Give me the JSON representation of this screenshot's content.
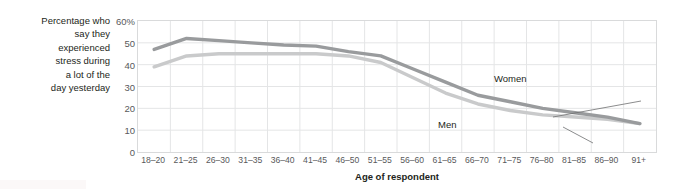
{
  "chart_data": {
    "type": "line",
    "title": "",
    "subtitle": "",
    "ylabel": "Percentage who say they experienced stress during a lot of the day yesterday",
    "xlabel": "Age of respondent",
    "categories": [
      "18–20",
      "21–25",
      "26–30",
      "31–35",
      "36–40",
      "41–45",
      "46–50",
      "51–55",
      "56–60",
      "61–65",
      "66–70",
      "71–75",
      "76–80",
      "81–85",
      "86–90",
      "91+"
    ],
    "ylim": [
      0,
      60
    ],
    "yticks": [
      0,
      10,
      20,
      30,
      40,
      50,
      60
    ],
    "ytick_labels": [
      "0",
      "10",
      "20",
      "30",
      "40",
      "50",
      "60%"
    ],
    "grid": true,
    "legend_position": "inline-annotations",
    "series": [
      {
        "name": "Women",
        "color": "#999b9d",
        "values": [
          47,
          52,
          51,
          50,
          49,
          48.5,
          46,
          44,
          38,
          32,
          26,
          23,
          20,
          18,
          16,
          13
        ]
      },
      {
        "name": "Men",
        "color": "#c9cacb",
        "values": [
          39,
          44,
          45,
          45,
          45,
          45,
          44,
          41,
          34,
          27,
          22,
          19,
          17,
          16,
          15,
          13
        ]
      }
    ],
    "annotations": [
      {
        "text": "Women",
        "series": "Women",
        "anchor_category": "66–70"
      },
      {
        "text": "Men",
        "series": "Men",
        "anchor_category": "66–70"
      }
    ]
  },
  "axis": {
    "y_caption": "Percentage who\nsay they\nexperienced\nstress during\na lot of the\nday yesterday",
    "x_title": "Age of respondent",
    "y_tick_labels": [
      "60%",
      "50",
      "40",
      "30",
      "20",
      "10",
      "0"
    ]
  },
  "colors": {
    "women_line": "#999b9d",
    "men_line": "#c9cacb",
    "grid": "#e4e5e6",
    "axis_border": "#d9dadb",
    "text_primary": "#231f20",
    "text_secondary": "#58595b",
    "background": "#ffffff"
  }
}
